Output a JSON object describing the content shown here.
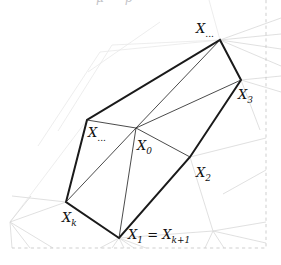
{
  "figure": {
    "title_clipped": "μ ρ",
    "background_color": "#ffffff",
    "edge_color": "#1a1a1a",
    "spoke_color": "#2a2a2a",
    "grid_color": "#d8d8d8",
    "grid_faint_color": "#e8e8e8",
    "border_color": "#c9c9c9",
    "border_style": "dashed",
    "width": 281,
    "height": 265
  },
  "labels": {
    "top": {
      "base": "X",
      "sub": "...",
      "x": 196,
      "y": 33
    },
    "x3": {
      "base": "X",
      "sub": "3",
      "x": 238,
      "y": 99
    },
    "xdots_left": {
      "base": "X",
      "sub": "...",
      "x": 88,
      "y": 137
    },
    "x0": {
      "base": "X",
      "sub": "0",
      "x": 137,
      "y": 150
    },
    "x2": {
      "base": "X",
      "sub": "2",
      "x": 196,
      "y": 177
    },
    "xk": {
      "base": "X",
      "sub": "k",
      "x": 62,
      "y": 222
    },
    "x1_eq": {
      "base": "X",
      "sub": "1",
      "relation": " = ",
      "base2": "X",
      "sub2": "k+1",
      "x": 128,
      "y": 239
    }
  },
  "vertices": {
    "X0": {
      "x": 136,
      "y": 128
    },
    "Xtop": {
      "x": 220,
      "y": 40
    },
    "X3": {
      "x": 241,
      "y": 80
    },
    "X2": {
      "x": 190,
      "y": 157
    },
    "X1": {
      "x": 119,
      "y": 238
    },
    "Xk": {
      "x": 66,
      "y": 202
    },
    "Xdots": {
      "x": 87,
      "y": 120
    }
  },
  "polygon": {
    "name": "star-shaped-polygon",
    "outline_points": "220,40 241,80 190,157 119,238 66,202 87,120",
    "closed": true
  },
  "spokes": [
    {
      "name": "spoke-X0-Xtop",
      "d": "M136,128 L220,40"
    },
    {
      "name": "spoke-X0-X3",
      "d": "M136,128 L241,80"
    },
    {
      "name": "spoke-X0-X2",
      "d": "M136,128 L190,157"
    },
    {
      "name": "spoke-X0-X1",
      "d": "M136,128 L119,238"
    },
    {
      "name": "spoke-X0-Xk",
      "d": "M136,128 L66,202"
    },
    {
      "name": "spoke-X0-Xdots",
      "d": "M136,128 L87,120"
    }
  ],
  "background_lines": [
    {
      "name": "bg-upper-left-long",
      "d": "M12,196 L66,202"
    },
    {
      "name": "bg-fan-top-a",
      "d": "M220,40 L281,18"
    },
    {
      "name": "bg-fan-top-b",
      "d": "M220,40 L281,34"
    },
    {
      "name": "bg-fan-top-c",
      "d": "M220,40 L281,49"
    },
    {
      "name": "bg-fan-top-d",
      "d": "M220,40 L281,66"
    },
    {
      "name": "bg-fan-top-e",
      "d": "M220,40 L241,80"
    },
    {
      "name": "bg-fan-top-up",
      "d": "M220,40 L209,0"
    },
    {
      "name": "bg-fan-x3-a",
      "d": "M241,80 L281,76"
    },
    {
      "name": "bg-fan-x3-b",
      "d": "M241,80 L281,92"
    },
    {
      "name": "bg-fan-x3-c",
      "d": "M241,80 L260,130"
    },
    {
      "name": "bg-ridge-1",
      "d": "M58,131 L112,45 L220,40"
    },
    {
      "name": "bg-ridge-2",
      "d": "M38,146 L100,52 L220,40"
    },
    {
      "name": "bg-left-a",
      "d": "M10,222 L87,120"
    },
    {
      "name": "bg-left-b",
      "d": "M10,222 L66,202"
    },
    {
      "name": "bg-left-c",
      "d": "M10,222 L31,196"
    },
    {
      "name": "bg-left-d",
      "d": "M10,222 L12,248"
    },
    {
      "name": "bg-left-e",
      "d": "M10,222 L30,248"
    },
    {
      "name": "bg-left-f",
      "d": "M10,222 L53,248"
    },
    {
      "name": "bg-bottom-a",
      "d": "M119,238 L100,248"
    },
    {
      "name": "bg-bottom-b",
      "d": "M119,238 L112,248"
    },
    {
      "name": "bg-bottom-c",
      "d": "M119,238 L124,248"
    },
    {
      "name": "bg-bottom-d",
      "d": "M119,238 L134,248"
    },
    {
      "name": "bg-bottom-e",
      "d": "M119,238 L146,248"
    },
    {
      "name": "bg-bottom-f",
      "d": "M119,238 L213,231"
    },
    {
      "name": "bg-right-low-a",
      "d": "M213,231 L266,222"
    },
    {
      "name": "bg-right-low-b",
      "d": "M213,231 L266,243"
    },
    {
      "name": "bg-right-low-c",
      "d": "M213,231 L205,248"
    },
    {
      "name": "bg-right-low-d",
      "d": "M213,231 L224,248"
    },
    {
      "name": "bg-mid-right-a",
      "d": "M190,157 L266,138"
    },
    {
      "name": "bg-mid-right-b",
      "d": "M190,157 L213,231"
    },
    {
      "name": "bg-mid-right-c",
      "d": "M241,80 L190,157"
    },
    {
      "name": "bg-far-right-a",
      "d": "M266,170 L223,194"
    },
    {
      "name": "bg-top-left-faint",
      "d": "M88,72 L160,22"
    }
  ],
  "clip_border": {
    "name": "figure-clip-border",
    "d": "M266,0 L266,248 L12,248"
  }
}
